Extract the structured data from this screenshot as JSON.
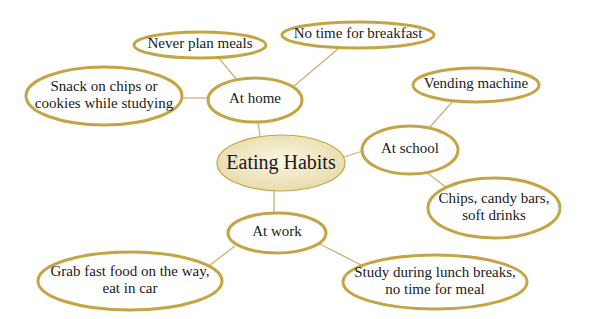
{
  "diagram": {
    "type": "mind-map",
    "colors": {
      "border": "#c4a545",
      "edge": "#c9b27a",
      "center_fill_light": "#fbf6e4",
      "center_fill_dark": "#e6d9a8",
      "text": "#1a1a1a"
    },
    "center": {
      "label": "Eating Habits",
      "cx": 281,
      "cy": 163,
      "rx": 64,
      "ry": 28
    },
    "nodes": [
      {
        "id": "at-home",
        "lines": [
          "At home"
        ],
        "cx": 255,
        "cy": 100,
        "rx": 47,
        "ry": 22
      },
      {
        "id": "at-school",
        "lines": [
          "At school"
        ],
        "cx": 410,
        "cy": 150,
        "rx": 48,
        "ry": 24
      },
      {
        "id": "at-work",
        "lines": [
          "At work"
        ],
        "cx": 277,
        "cy": 233,
        "rx": 49,
        "ry": 20
      },
      {
        "id": "never-plan-meals",
        "lines": [
          "Never plan meals"
        ],
        "cx": 200,
        "cy": 45,
        "rx": 66,
        "ry": 13
      },
      {
        "id": "no-time-breakfast",
        "lines": [
          "No time for breakfast"
        ],
        "cx": 358,
        "cy": 35,
        "rx": 76,
        "ry": 13
      },
      {
        "id": "snack-chips",
        "lines": [
          "Snack on chips or",
          "cookies while studying"
        ],
        "cx": 104,
        "cy": 96,
        "rx": 78,
        "ry": 29
      },
      {
        "id": "vending-machine",
        "lines": [
          "Vending machine"
        ],
        "cx": 476,
        "cy": 85,
        "rx": 63,
        "ry": 17
      },
      {
        "id": "chips-candy",
        "lines": [
          "Chips, candy bars,",
          "soft drinks"
        ],
        "cx": 494,
        "cy": 208,
        "rx": 66,
        "ry": 30
      },
      {
        "id": "grab-fast-food",
        "lines": [
          "Grab fast food on the way,",
          "eat in car"
        ],
        "cx": 130,
        "cy": 281,
        "rx": 92,
        "ry": 29
      },
      {
        "id": "study-lunch",
        "lines": [
          "Study during lunch breaks,",
          "no time for meal"
        ],
        "cx": 435,
        "cy": 282,
        "rx": 92,
        "ry": 27
      }
    ],
    "edges": [
      {
        "from": "center",
        "to": "at-home",
        "x1": 260,
        "y1": 136,
        "x2": 258,
        "y2": 122
      },
      {
        "from": "center",
        "to": "at-school",
        "x1": 344,
        "y1": 157,
        "x2": 363,
        "y2": 151
      },
      {
        "from": "center",
        "to": "at-work",
        "x1": 274,
        "y1": 190,
        "x2": 274,
        "y2": 213
      },
      {
        "from": "at-home",
        "to": "never-plan-meals",
        "x1": 237,
        "y1": 80,
        "x2": 218,
        "y2": 57
      },
      {
        "from": "at-home",
        "to": "no-time-breakfast",
        "x1": 293,
        "y1": 87,
        "x2": 339,
        "y2": 48
      },
      {
        "from": "at-home",
        "to": "snack-chips",
        "x1": 208,
        "y1": 98,
        "x2": 182,
        "y2": 98
      },
      {
        "from": "at-school",
        "to": "vending-machine",
        "x1": 430,
        "y1": 127,
        "x2": 453,
        "y2": 101
      },
      {
        "from": "at-school",
        "to": "chips-candy",
        "x1": 426,
        "y1": 172,
        "x2": 447,
        "y2": 188
      },
      {
        "from": "at-work",
        "to": "grab-fast-food",
        "x1": 235,
        "y1": 246,
        "x2": 210,
        "y2": 265
      },
      {
        "from": "at-work",
        "to": "study-lunch",
        "x1": 318,
        "y1": 243,
        "x2": 365,
        "y2": 267
      }
    ]
  }
}
